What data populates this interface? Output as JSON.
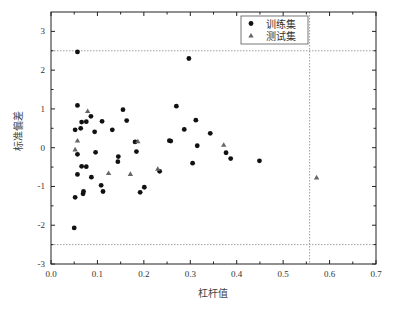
{
  "chart_data": {
    "type": "scatter",
    "title": "",
    "xlabel": "杠杆值",
    "ylabel": "标准偏差",
    "xlim": [
      0.0,
      0.7
    ],
    "ylim": [
      -3,
      3.5
    ],
    "x_ticks": [
      "0.0",
      "0.1",
      "0.2",
      "0.3",
      "0.4",
      "0.5",
      "0.6",
      "0.7"
    ],
    "y_ticks": [
      "-3",
      "-2",
      "-1",
      "0",
      "1",
      "2",
      "3"
    ],
    "grid": false,
    "legend_position": "upper right (inside)",
    "reference_lines": {
      "horizontal": [
        2.5,
        -2.5
      ],
      "vertical": [
        0.557
      ],
      "style": "dotted"
    },
    "series": [
      {
        "name": "训练集",
        "marker": "circle",
        "color": "#111111",
        "points": [
          [
            0.057,
            2.47
          ],
          [
            0.297,
            2.3
          ],
          [
            0.057,
            1.09
          ],
          [
            0.27,
            1.07
          ],
          [
            0.155,
            0.98
          ],
          [
            0.086,
            0.81
          ],
          [
            0.312,
            0.71
          ],
          [
            0.163,
            0.7
          ],
          [
            0.11,
            0.68
          ],
          [
            0.076,
            0.67
          ],
          [
            0.066,
            0.66
          ],
          [
            0.064,
            0.5
          ],
          [
            0.287,
            0.47
          ],
          [
            0.132,
            0.46
          ],
          [
            0.052,
            0.46
          ],
          [
            0.094,
            0.41
          ],
          [
            0.343,
            0.37
          ],
          [
            0.255,
            0.18
          ],
          [
            0.258,
            0.17
          ],
          [
            0.181,
            0.15
          ],
          [
            0.315,
            0.05
          ],
          [
            0.184,
            -0.1
          ],
          [
            0.096,
            -0.12
          ],
          [
            0.377,
            -0.13
          ],
          [
            0.057,
            -0.17
          ],
          [
            0.145,
            -0.23
          ],
          [
            0.387,
            -0.28
          ],
          [
            0.449,
            -0.34
          ],
          [
            0.144,
            -0.36
          ],
          [
            0.305,
            -0.4
          ],
          [
            0.066,
            -0.48
          ],
          [
            0.076,
            -0.49
          ],
          [
            0.234,
            -0.61
          ],
          [
            0.057,
            -0.69
          ],
          [
            0.087,
            -0.76
          ],
          [
            0.108,
            -0.97
          ],
          [
            0.201,
            -1.02
          ],
          [
            0.112,
            -1.13
          ],
          [
            0.07,
            -1.13
          ],
          [
            0.192,
            -1.15
          ],
          [
            0.069,
            -1.19
          ],
          [
            0.052,
            -1.28
          ],
          [
            0.05,
            -2.07
          ]
        ]
      },
      {
        "name": "测试集",
        "marker": "triangle",
        "color": "#666666",
        "points": [
          [
            0.079,
            0.94
          ],
          [
            0.057,
            0.18
          ],
          [
            0.187,
            0.16
          ],
          [
            0.372,
            0.07
          ],
          [
            0.052,
            -0.05
          ],
          [
            0.23,
            -0.55
          ],
          [
            0.124,
            -0.66
          ],
          [
            0.171,
            -0.68
          ],
          [
            0.572,
            -0.77
          ]
        ]
      }
    ]
  },
  "legend": {
    "items": [
      {
        "label": "训练集",
        "marker": "circle"
      },
      {
        "label": "测试集",
        "marker": "triangle"
      }
    ]
  }
}
